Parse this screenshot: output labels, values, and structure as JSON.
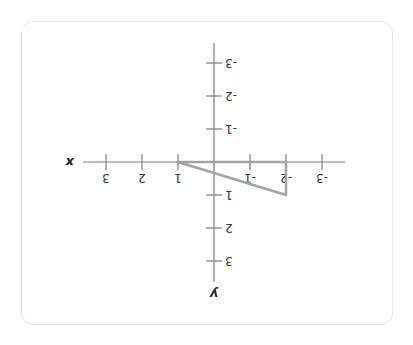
{
  "diagram": {
    "type": "coordinate-plane",
    "orientation": "rotated 180 degrees",
    "axes": {
      "x_label": "x",
      "y_label": "y",
      "x_ticks": [
        -3,
        -2,
        -1,
        1,
        2,
        3
      ],
      "y_ticks": [
        -3,
        -2,
        -1,
        1,
        2,
        3
      ],
      "x_tick_labels": [
        "-3",
        "-2",
        "-1",
        "1",
        "2",
        "3"
      ],
      "y_tick_labels": [
        "-3",
        "-2",
        "-1",
        "1",
        "2",
        "3"
      ]
    },
    "shape": {
      "type": "triangle",
      "vertices": [
        [
          1,
          0
        ],
        [
          -2,
          0
        ],
        [
          -2,
          1
        ]
      ],
      "stroke_color": "#a3a3a3"
    },
    "colors": {
      "axis": "#7a7a7a",
      "card_border": "#e6e6e6",
      "background": "#ffffff"
    }
  }
}
